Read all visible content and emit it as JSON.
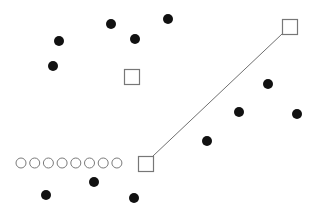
{
  "canvas": {
    "width": 318,
    "height": 214,
    "background": "#ffffff"
  },
  "colors": {
    "dot_fill": "#111111",
    "square_stroke": "#777777",
    "line_stroke": "#707070",
    "ring_stroke": "#7a7a7a"
  },
  "dots": [
    {
      "x": 59,
      "y": 41
    },
    {
      "x": 111,
      "y": 24
    },
    {
      "x": 135,
      "y": 39
    },
    {
      "x": 168,
      "y": 19
    },
    {
      "x": 53,
      "y": 66
    },
    {
      "x": 268,
      "y": 84
    },
    {
      "x": 239,
      "y": 112
    },
    {
      "x": 297,
      "y": 114
    },
    {
      "x": 207,
      "y": 141
    },
    {
      "x": 46,
      "y": 195
    },
    {
      "x": 94,
      "y": 182
    },
    {
      "x": 134,
      "y": 198
    }
  ],
  "dot_radius": 5,
  "squares": [
    {
      "name": "square-middle",
      "x": 124,
      "y": 69,
      "size": 15
    },
    {
      "name": "square-top-right",
      "x": 282,
      "y": 19,
      "size": 15
    },
    {
      "name": "square-bottom",
      "x": 138,
      "y": 156,
      "size": 15
    }
  ],
  "connector": {
    "x1": 282,
    "y1": 34,
    "x2": 153,
    "y2": 156
  },
  "rings": {
    "count": 8,
    "start_x": 21,
    "y": 163,
    "spacing": 13.7,
    "radius": 5
  }
}
